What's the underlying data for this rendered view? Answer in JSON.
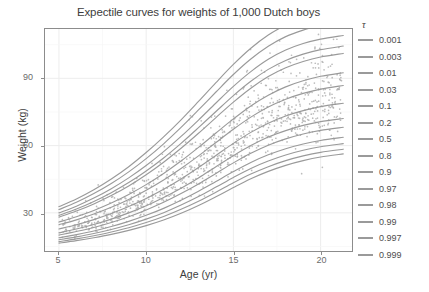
{
  "chart_data": {
    "type": "line",
    "title": "Expectile curves for weights of 1,000 Dutch boys",
    "xlabel": "Age (yr)",
    "ylabel": "Weight (kg)",
    "xlim": [
      4.2,
      21.8
    ],
    "ylim": [
      13,
      112
    ],
    "xticks": [
      5,
      10,
      15,
      20
    ],
    "xtick_labels": [
      "5",
      "10",
      "15",
      "20"
    ],
    "yticks": [
      30,
      60,
      90
    ],
    "ytick_labels": [
      "30",
      "60",
      "90"
    ],
    "grid": true,
    "legend_position": "right",
    "legend_title": "τ",
    "line_color": "#9a9a9a",
    "point_color": "#b0b0b0",
    "panel_background": "#ffffff",
    "grid_color": "#f0f0f0",
    "n_points": 1000,
    "x": [
      5,
      6,
      7,
      8,
      9,
      10,
      11,
      12,
      13,
      14,
      15,
      16,
      17,
      18,
      19,
      20,
      21.3
    ],
    "series": [
      {
        "name": "0.001",
        "values": [
          16.5,
          17.6,
          18.9,
          20.4,
          22.2,
          24.3,
          26.8,
          29.8,
          33.3,
          37.2,
          41.3,
          45.2,
          48.5,
          51.2,
          53.3,
          54.9,
          56.3
        ]
      },
      {
        "name": "0.003",
        "values": [
          17.2,
          18.4,
          19.8,
          21.5,
          23.4,
          25.7,
          28.4,
          31.6,
          35.2,
          39.2,
          43.4,
          47.3,
          50.6,
          53.3,
          55.4,
          57.0,
          58.4
        ]
      },
      {
        "name": "0.01",
        "values": [
          18.0,
          19.3,
          20.8,
          22.6,
          24.7,
          27.2,
          30.1,
          33.5,
          37.3,
          41.5,
          45.8,
          49.8,
          53.1,
          55.8,
          57.9,
          59.5,
          60.9
        ]
      },
      {
        "name": "0.03",
        "values": [
          18.9,
          20.3,
          21.9,
          23.9,
          26.2,
          28.9,
          32.0,
          35.6,
          39.6,
          44.0,
          48.4,
          52.5,
          55.9,
          58.6,
          60.7,
          62.3,
          63.7
        ]
      },
      {
        "name": "0.1",
        "values": [
          20.1,
          21.7,
          23.5,
          25.7,
          28.3,
          31.3,
          34.7,
          38.6,
          42.9,
          47.6,
          52.3,
          56.6,
          60.2,
          63.0,
          65.2,
          66.8,
          68.2
        ]
      },
      {
        "name": "0.2",
        "values": [
          21.1,
          22.8,
          24.8,
          27.2,
          30.0,
          33.2,
          36.9,
          41.0,
          45.6,
          50.6,
          55.5,
          60.0,
          63.8,
          66.7,
          69.0,
          70.7,
          72.1
        ]
      },
      {
        "name": "0.5",
        "values": [
          22.8,
          24.7,
          27.0,
          29.7,
          32.8,
          36.4,
          40.5,
          45.1,
          50.2,
          55.6,
          61.0,
          65.9,
          70.0,
          73.2,
          75.6,
          77.4,
          78.9
        ]
      },
      {
        "name": "0.8",
        "values": [
          24.7,
          26.9,
          29.5,
          32.5,
          36.0,
          40.1,
          44.7,
          49.8,
          55.4,
          61.4,
          67.3,
          72.7,
          77.2,
          80.7,
          83.3,
          85.2,
          86.8
        ]
      },
      {
        "name": "0.9",
        "values": [
          25.9,
          28.3,
          31.1,
          34.4,
          38.2,
          42.6,
          47.6,
          53.1,
          59.2,
          65.6,
          71.9,
          77.7,
          82.5,
          86.2,
          88.9,
          90.9,
          92.5
        ]
      },
      {
        "name": "0.97",
        "values": [
          28.1,
          30.8,
          34.0,
          37.7,
          42.0,
          47.0,
          52.6,
          58.8,
          65.5,
          72.5,
          79.4,
          85.6,
          90.8,
          94.7,
          97.5,
          99.5,
          101.1
        ]
      },
      {
        "name": "0.98",
        "values": [
          28.9,
          31.7,
          35.1,
          39.0,
          43.5,
          48.7,
          54.5,
          61.0,
          68.0,
          75.2,
          82.3,
          88.7,
          94.0,
          98.0,
          100.8,
          102.8,
          104.4
        ]
      },
      {
        "name": "0.99",
        "values": [
          30.0,
          33.0,
          36.6,
          40.8,
          45.6,
          51.1,
          57.3,
          64.1,
          71.4,
          79.0,
          86.4,
          93.0,
          98.5,
          102.6,
          105.5,
          107.5,
          109.1
        ]
      },
      {
        "name": "0.997",
        "values": [
          31.5,
          34.7,
          38.6,
          43.1,
          48.3,
          54.2,
          60.8,
          68.1,
          75.9,
          83.9,
          91.7,
          98.6,
          104.3,
          108.6,
          111.5,
          113.6,
          115.2
        ]
      },
      {
        "name": "0.999",
        "values": [
          32.8,
          36.2,
          40.3,
          45.1,
          50.6,
          56.9,
          63.9,
          71.5,
          79.7,
          88.1,
          96.2,
          103.4,
          109.3,
          113.7,
          116.7,
          118.8,
          120.4
        ]
      }
    ]
  },
  "legend": {
    "title": "τ",
    "entries": [
      {
        "label": "0.001"
      },
      {
        "label": "0.003"
      },
      {
        "label": "0.01"
      },
      {
        "label": "0.03"
      },
      {
        "label": "0.1"
      },
      {
        "label": "0.2"
      },
      {
        "label": "0.5"
      },
      {
        "label": "0.8"
      },
      {
        "label": "0.9"
      },
      {
        "label": "0.97"
      },
      {
        "label": "0.98"
      },
      {
        "label": "0.99"
      },
      {
        "label": "0.997"
      },
      {
        "label": "0.999"
      }
    ]
  }
}
